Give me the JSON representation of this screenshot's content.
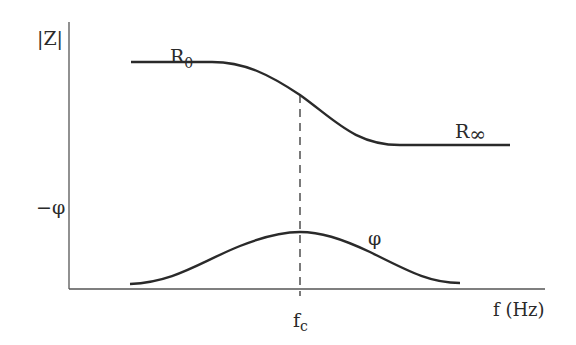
{
  "diagram": {
    "colors": {
      "line": "#2a2a2a",
      "axis": "#555555",
      "background": "#ffffff"
    },
    "labels": {
      "y_axis_top": "|Z|",
      "y_axis_bottom": "−φ",
      "x_axis": "f (Hz)",
      "r0_main": "R",
      "r0_sub": "0",
      "rinf_main": "R",
      "rinf_sub": "∞",
      "phase_curve": "φ",
      "fc_main": "f",
      "fc_sub": "c"
    },
    "curves": [
      {
        "name": "magnitude",
        "description": "|Z| decreases from R0 to R∞ around fc"
      },
      {
        "name": "phase",
        "description": "−φ bell-shaped peak at fc"
      }
    ],
    "marker": {
      "name": "fc",
      "style": "dashed vertical line"
    }
  }
}
